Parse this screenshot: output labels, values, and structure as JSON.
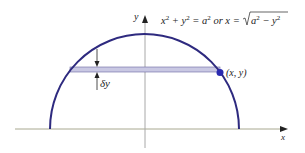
{
  "diagram": {
    "equation": "x² + y² = a² or x = √(a² − y²)",
    "equation_parts": {
      "lhs": "x",
      "sup2": "2",
      "plus": " + y",
      "eq": " = a",
      "or": " or x = ",
      "sqrt_body": "a",
      "minus": " − y"
    },
    "axis_x_label": "x",
    "axis_y_label": "y",
    "point_label": "(x, y)",
    "strip_label": "δy",
    "colors": {
      "curve": "#2e2a7f",
      "strip_fill": "#c9c8e3",
      "strip_edge": "#5a5690",
      "axis": "#9a9a8a",
      "point": "#2a2ab0"
    }
  }
}
